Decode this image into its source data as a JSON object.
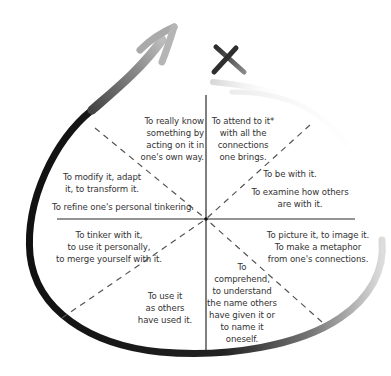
{
  "diagram": {
    "type": "eight-part circular model with loop arrow",
    "center": {
      "x": 206,
      "y": 219
    },
    "colors": {
      "loop_dark": "#1a1a1a",
      "loop_light": "#cfcfcf",
      "arrow_gray": "#9a9a9a",
      "axis_line": "#2a2a2a",
      "dashed_line": "#555555",
      "text": "#333333",
      "x_mark": "#3a3a3a"
    },
    "icons": {
      "loop_arrow": "curved-arrow-icon",
      "x_mark": "x-mark-icon"
    },
    "segments": [
      {
        "id": "upper-left-inner",
        "lines": [
          "To really know",
          "something by",
          "acting on it in",
          "one's own way."
        ]
      },
      {
        "id": "upper-right-inner",
        "lines": [
          "To attend to it*",
          "with all the",
          "connections",
          "one brings."
        ]
      },
      {
        "id": "left-upper",
        "lines": [
          "To modify it, adapt",
          "it, to transform it."
        ]
      },
      {
        "id": "left-upper-bottom",
        "lines": [
          "To refine one's personal tinkering."
        ]
      },
      {
        "id": "right-upper",
        "lines": [
          "To be with it."
        ]
      },
      {
        "id": "right-upper-bottom",
        "lines": [
          "To examine how others",
          "are with it."
        ]
      },
      {
        "id": "left-lower",
        "lines": [
          "To tinker with it,",
          "to use it personally,",
          "to merge yourself with it."
        ]
      },
      {
        "id": "right-lower",
        "lines": [
          "To picture it, to image it.",
          "To make a metaphor",
          "from one's connections."
        ]
      },
      {
        "id": "lower-left-inner",
        "lines": [
          "To use it",
          "as others",
          "have used it."
        ]
      },
      {
        "id": "lower-right-inner",
        "lines": [
          "To",
          "comprehend,",
          "to understand",
          "the name others",
          "have given it or",
          "to name it",
          "oneself."
        ]
      }
    ]
  }
}
